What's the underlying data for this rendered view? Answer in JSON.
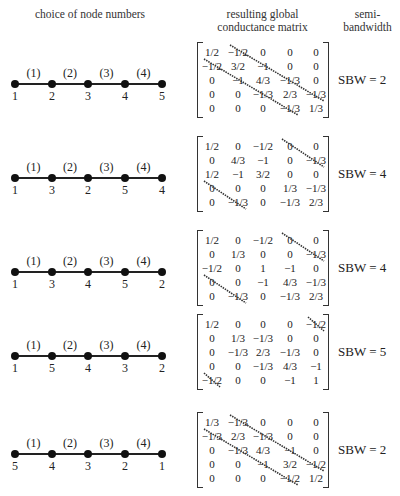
{
  "headers": {
    "col1": "choice of node numbers",
    "col2_line1": "resulting global",
    "col2_line2": "conductance matrix",
    "col3_line1": "semi-",
    "col3_line2": "bandwidth"
  },
  "element_labels": [
    "(1)",
    "(2)",
    "(3)",
    "(4)"
  ],
  "rows": [
    {
      "nodes": [
        "1",
        "2",
        "3",
        "4",
        "5"
      ],
      "matrix": [
        [
          "1/2",
          "−1/2",
          "0",
          "0",
          "0"
        ],
        [
          "−1/2",
          "3/2",
          "−1",
          "0",
          "0"
        ],
        [
          "0",
          "−1",
          "4/3",
          "−1/3",
          "0"
        ],
        [
          "0",
          "0",
          "−1/3",
          "2/3",
          "−1/3"
        ],
        [
          "0",
          "0",
          "0",
          "−1/3",
          "1/3"
        ]
      ],
      "sbw_value": 2,
      "sbw_label": "SBW = 2"
    },
    {
      "nodes": [
        "1",
        "3",
        "2",
        "5",
        "4"
      ],
      "matrix": [
        [
          "1/2",
          "0",
          "−1/2",
          "0",
          "0"
        ],
        [
          "0",
          "4/3",
          "−1",
          "0",
          "−1/3"
        ],
        [
          "1/2",
          "−1",
          "3/2",
          "0",
          "0"
        ],
        [
          "0",
          "0",
          "0",
          "1/3",
          "−1/3"
        ],
        [
          "0",
          "−1/3",
          "0",
          "−1/3",
          "2/3"
        ]
      ],
      "sbw_value": 4,
      "sbw_label": "SBW = 4"
    },
    {
      "nodes": [
        "1",
        "3",
        "4",
        "5",
        "2"
      ],
      "matrix": [
        [
          "1/2",
          "0",
          "−1/2",
          "0",
          "0"
        ],
        [
          "0",
          "1/3",
          "0",
          "0",
          "−1/3"
        ],
        [
          "−1/2",
          "0",
          "1",
          "−1",
          "0"
        ],
        [
          "0",
          "0",
          "−1",
          "4/3",
          "−1/3"
        ],
        [
          "0",
          "−1/3",
          "0",
          "−1/3",
          "2/3"
        ]
      ],
      "sbw_value": 4,
      "sbw_label": "SBW = 4"
    },
    {
      "nodes": [
        "1",
        "5",
        "4",
        "3",
        "2"
      ],
      "matrix": [
        [
          "1/2",
          "0",
          "0",
          "0",
          "−1/2"
        ],
        [
          "0",
          "1/3",
          "−1/3",
          "0",
          "0"
        ],
        [
          "0",
          "−1/3",
          "2/3",
          "−1/3",
          "0"
        ],
        [
          "0",
          "0",
          "−1/3",
          "4/3",
          "−1"
        ],
        [
          "−1/2",
          "0",
          "0",
          "−1",
          "1"
        ]
      ],
      "sbw_value": 5,
      "sbw_label": "SBW = 5"
    },
    {
      "nodes": [
        "5",
        "4",
        "3",
        "2",
        "1"
      ],
      "matrix": [
        [
          "1/3",
          "−1/3",
          "0",
          "0",
          "0"
        ],
        [
          "−1/3",
          "2/3",
          "−1/3",
          "0",
          "0"
        ],
        [
          "0",
          "−1/3",
          "4/3",
          "−1",
          "0"
        ],
        [
          "0",
          "0",
          "−1",
          "3/2",
          "−1/2"
        ],
        [
          "0",
          "0",
          "0",
          "−1/2",
          "1/2"
        ]
      ],
      "sbw_value": 2,
      "sbw_label": "SBW = 2"
    }
  ],
  "colors": {
    "ink": "#222222",
    "band_line": "#333333"
  }
}
